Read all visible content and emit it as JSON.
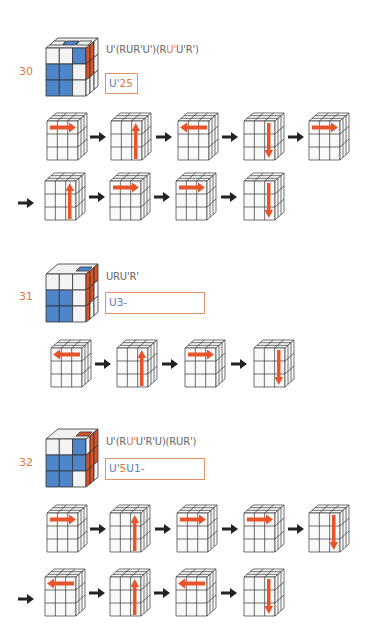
{
  "colors": {
    "accent_orange": "#e07a3a",
    "cube_blue": "#4f86c9",
    "cube_red": "#d9542a",
    "code_blue": "#5a7fc0",
    "move_arrow": "#e8542a",
    "step_arrow": "#222222"
  },
  "cases": [
    {
      "number": "30",
      "algorithm_parts": [
        "U'(RUR'U')(R",
        "U'",
        "U'R')"
      ],
      "code_parts": [
        "U'",
        "25"
      ],
      "move_rows": [
        [
          "right",
          "up",
          "left",
          "down",
          "right"
        ],
        [
          "up",
          "right",
          "right",
          "down"
        ]
      ]
    },
    {
      "number": "31",
      "algorithm_parts": [
        "URU'R'"
      ],
      "code_parts": [
        "U3-"
      ],
      "move_rows": [
        [
          "left",
          "up",
          "right",
          "down"
        ]
      ]
    },
    {
      "number": "32",
      "algorithm_parts": [
        "U'(R",
        "U'",
        "U'R'U)(RUR')"
      ],
      "code_parts": [
        "U'",
        "5",
        "U1-"
      ],
      "move_rows": [
        [
          "right",
          "up",
          "right",
          "right",
          "down"
        ],
        [
          "left",
          "up",
          "left",
          "down"
        ]
      ]
    }
  ],
  "icons": {
    "move_cube": "cube-3x3-icon",
    "step_arrow": "arrow-right-icon",
    "move_arrows": [
      "arrow-right-move-icon",
      "arrow-up-move-icon",
      "arrow-left-move-icon",
      "arrow-down-move-icon"
    ]
  }
}
